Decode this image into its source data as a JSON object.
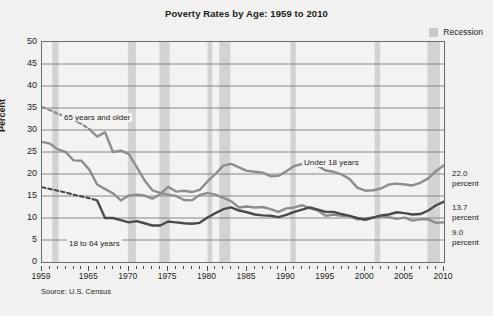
{
  "chart_data": {
    "type": "line",
    "title": "Poverty Rates by Age: 1959 to 2010",
    "xlabel": "",
    "ylabel": "Percent",
    "xlim": [
      1959,
      2010
    ],
    "ylim": [
      0,
      50
    ],
    "ytick_step": 5,
    "yticks": [
      0,
      5,
      10,
      15,
      20,
      25,
      30,
      35,
      40,
      45,
      50
    ],
    "xticks_labeled": [
      1959,
      1965,
      1970,
      1975,
      1980,
      1985,
      1990,
      1995,
      2000,
      2005,
      2010
    ],
    "xtick_interval_minor": 1,
    "grid": "horizontal",
    "legend_position": "top-right",
    "source": "Source: U.S. Census",
    "legend": [
      {
        "label": "Recession",
        "color": "#c9c9c9",
        "type": "band"
      }
    ],
    "recession_bands": [
      {
        "start": 1960.3,
        "end": 1961.1
      },
      {
        "start": 1969.9,
        "end": 1970.9
      },
      {
        "start": 1973.9,
        "end": 1975.2
      },
      {
        "start": 1980.0,
        "end": 1980.6
      },
      {
        "start": 1981.5,
        "end": 1982.9
      },
      {
        "start": 1990.5,
        "end": 1991.2
      },
      {
        "start": 2001.2,
        "end": 2001.9
      },
      {
        "start": 2007.9,
        "end": 2009.5
      }
    ],
    "series": [
      {
        "name": "65 years and older",
        "label": "65 years and older",
        "color": "#8d8d8d",
        "end_value": "9.0",
        "end_label": "9.0\npercent",
        "dashed_segment_years": [
          1959,
          1965
        ],
        "x": [
          1959,
          1960,
          1961,
          1962,
          1963,
          1964,
          1965,
          1966,
          1967,
          1968,
          1969,
          1970,
          1971,
          1972,
          1973,
          1974,
          1975,
          1976,
          1977,
          1978,
          1979,
          1980,
          1981,
          1982,
          1983,
          1984,
          1985,
          1986,
          1987,
          1988,
          1989,
          1990,
          1991,
          1992,
          1993,
          1994,
          1995,
          1996,
          1997,
          1998,
          1999,
          2000,
          2001,
          2002,
          2003,
          2004,
          2005,
          2006,
          2007,
          2008,
          2009,
          2010
        ],
        "values": [
          35.2,
          34.5,
          33.7,
          33.0,
          32.2,
          31.4,
          30.2,
          28.5,
          29.5,
          25.0,
          25.3,
          24.6,
          21.6,
          18.6,
          16.3,
          15.7,
          15.3,
          15.0,
          14.1,
          14.0,
          15.2,
          15.7,
          15.3,
          14.6,
          13.8,
          12.4,
          12.6,
          12.4,
          12.5,
          12.0,
          11.4,
          12.2,
          12.4,
          12.9,
          12.2,
          11.7,
          10.5,
          10.8,
          10.5,
          10.5,
          9.7,
          9.9,
          10.1,
          10.4,
          10.2,
          9.8,
          10.1,
          9.4,
          9.7,
          9.7,
          8.9,
          9.0
        ]
      },
      {
        "name": "Under 18 years",
        "label": "Under 18 years",
        "color": "#8d8d8d",
        "end_value": "22.0",
        "end_label": "22.0\npercent",
        "x": [
          1959,
          1960,
          1961,
          1962,
          1963,
          1964,
          1965,
          1966,
          1967,
          1968,
          1969,
          1970,
          1971,
          1972,
          1973,
          1974,
          1975,
          1976,
          1977,
          1978,
          1979,
          1980,
          1981,
          1982,
          1983,
          1984,
          1985,
          1986,
          1987,
          1988,
          1989,
          1990,
          1991,
          1992,
          1993,
          1994,
          1995,
          1996,
          1997,
          1998,
          1999,
          2000,
          2001,
          2002,
          2003,
          2004,
          2005,
          2006,
          2007,
          2008,
          2009,
          2010
        ],
        "values": [
          27.3,
          26.9,
          25.6,
          25.0,
          23.1,
          23.0,
          21.0,
          17.6,
          16.6,
          15.6,
          14.0,
          15.1,
          15.3,
          15.1,
          14.4,
          15.4,
          17.1,
          16.0,
          16.2,
          15.9,
          16.4,
          18.3,
          20.0,
          21.9,
          22.3,
          21.5,
          20.7,
          20.5,
          20.3,
          19.5,
          19.6,
          20.6,
          21.8,
          22.3,
          22.7,
          21.8,
          20.8,
          20.5,
          19.9,
          18.9,
          16.9,
          16.2,
          16.3,
          16.7,
          17.6,
          17.8,
          17.6,
          17.4,
          18.0,
          19.0,
          20.7,
          22.0
        ]
      },
      {
        "name": "18 to 64 years",
        "label": "18 to 64 years",
        "color": "#4a4a4a",
        "end_value": "13.7",
        "end_label": "13.7\npercent",
        "dashed_segment_years": [
          1959,
          1966
        ],
        "x": [
          1959,
          1960,
          1961,
          1962,
          1963,
          1964,
          1965,
          1966,
          1967,
          1968,
          1969,
          1970,
          1971,
          1972,
          1973,
          1974,
          1975,
          1976,
          1977,
          1978,
          1979,
          1980,
          1981,
          1982,
          1983,
          1984,
          1985,
          1986,
          1987,
          1988,
          1989,
          1990,
          1991,
          1992,
          1993,
          1994,
          1995,
          1996,
          1997,
          1998,
          1999,
          2000,
          2001,
          2002,
          2003,
          2004,
          2005,
          2006,
          2007,
          2008,
          2009,
          2010
        ],
        "values": [
          17.0,
          16.6,
          16.2,
          15.8,
          15.3,
          14.9,
          14.5,
          14.0,
          10.0,
          10.0,
          9.5,
          9.0,
          9.3,
          8.8,
          8.3,
          8.3,
          9.2,
          9.0,
          8.8,
          8.7,
          8.9,
          10.1,
          11.1,
          12.0,
          12.4,
          11.7,
          11.3,
          10.8,
          10.6,
          10.5,
          10.2,
          10.7,
          11.4,
          11.9,
          12.4,
          11.9,
          11.4,
          11.4,
          10.9,
          10.5,
          10.0,
          9.6,
          10.1,
          10.6,
          10.8,
          11.3,
          11.1,
          10.8,
          10.9,
          11.7,
          12.9,
          13.7
        ]
      }
    ],
    "series_label_positions": [
      {
        "label": "65 years and older",
        "x_px": 62,
        "y_px": 113
      },
      {
        "label": "Under 18 years",
        "x_px": 302,
        "y_px": 158
      },
      {
        "label": "18 to 64 years",
        "x_px": 67,
        "y_px": 239
      }
    ],
    "right_annotations": [
      {
        "value": "22.0",
        "unit": "percent",
        "y_px": 169
      },
      {
        "value": "13.7",
        "unit": "percent",
        "y_px": 203
      },
      {
        "value": "9.0",
        "unit": "percent",
        "y_px": 228
      }
    ]
  }
}
